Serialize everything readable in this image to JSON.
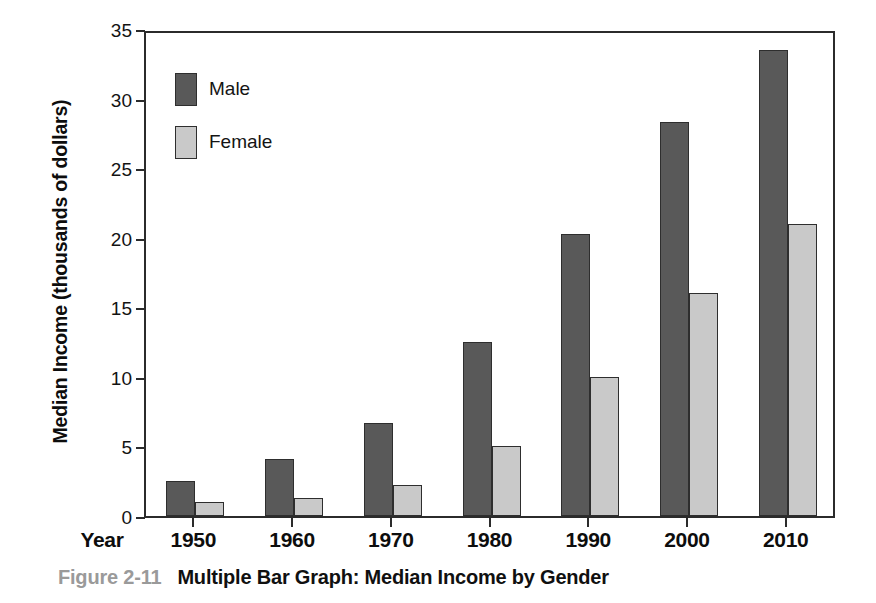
{
  "figure": {
    "number_label": "Figure 2-11",
    "caption_text": "Multiple Bar Graph: Median Income by Gender"
  },
  "axes": {
    "x_axis_name": "Year",
    "y_axis_title": "Median Income (thousands of dollars)"
  },
  "legend": {
    "items": [
      {
        "label": "Male",
        "color": "#595959"
      },
      {
        "label": "Female",
        "color": "#c9c9c9"
      }
    ]
  },
  "chart_data": {
    "type": "bar",
    "title": "Multiple Bar Graph: Median Income by Gender",
    "xlabel": "Year",
    "ylabel": "Median Income (thousands of dollars)",
    "categories": [
      "1950",
      "1960",
      "1970",
      "1980",
      "1990",
      "2000",
      "2010"
    ],
    "series": [
      {
        "name": "Male",
        "color": "#595959",
        "values": [
          2.5,
          4.1,
          6.7,
          12.5,
          20.3,
          28.3,
          33.5
        ]
      },
      {
        "name": "Female",
        "color": "#c9c9c9",
        "values": [
          1.0,
          1.3,
          2.2,
          5.0,
          10.0,
          16.0,
          21.0
        ]
      }
    ],
    "ylim": [
      0,
      35
    ],
    "yticks": [
      0,
      5,
      10,
      15,
      20,
      25,
      30,
      35
    ],
    "ytick_labels": [
      "0",
      "5",
      "10",
      "15",
      "20",
      "25",
      "30",
      "35"
    ],
    "grid": false,
    "legend_position": "upper-left-inside"
  }
}
